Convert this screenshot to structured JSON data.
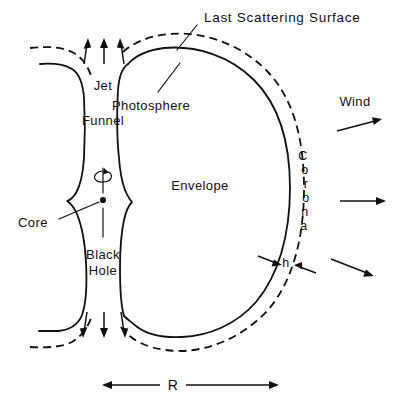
{
  "figure": {
    "kind": "schematic-diagram",
    "background_color": "#ffffff",
    "ink_color": "#111111"
  },
  "labels": {
    "last_scattering_surface": "Last Scattering Surface",
    "photosphere": "Photosphere",
    "envelope": "Envelope",
    "jet": "Jet",
    "funnel": "Funnel",
    "core": "Core",
    "black_hole_line1": "Black",
    "black_hole_line2": "Hole",
    "wind": "Wind",
    "corona": "Corona",
    "h_gap": "h",
    "radius": "R"
  },
  "corona_letters": [
    "C",
    "o",
    "r",
    "o",
    "n",
    "a"
  ],
  "annotations": {
    "jet_arrow_count_top": 3,
    "jet_arrow_count_bottom": 3,
    "wind_arrow_count": 3,
    "rotation_axis": "vertical spin axis through core",
    "spin_arrow": "curved rotation arrow around axis"
  },
  "legend_semantics": {
    "solid_curve": "photosphere / envelope boundary",
    "dashed_curve": "last scattering surface (outer corona boundary)",
    "gap_between_curves": "corona of thickness h"
  }
}
